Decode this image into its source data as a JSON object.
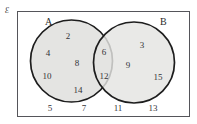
{
  "figure": {
    "type": "venn-diagram",
    "universe_label": "Ɛ",
    "set_a_label": "A",
    "set_b_label": "B",
    "colors": {
      "circle_fill": "#e4e4e2",
      "circle_stroke": "#1d1d1d",
      "rect_stroke": "#55555a",
      "background": "#ffffff",
      "text": "#333337"
    },
    "regions": {
      "a_only": {
        "name": "A only",
        "members": [
          {
            "value": "2",
            "x": 68,
            "y": 36
          },
          {
            "value": "4",
            "x": 48,
            "y": 53
          },
          {
            "value": "8",
            "x": 77,
            "y": 63
          },
          {
            "value": "10",
            "x": 47,
            "y": 76
          },
          {
            "value": "14",
            "x": 78,
            "y": 90
          }
        ]
      },
      "intersection": {
        "name": "A and B",
        "members": [
          {
            "value": "6",
            "x": 104,
            "y": 52
          },
          {
            "value": "12",
            "x": 104,
            "y": 76
          }
        ]
      },
      "b_only": {
        "name": "B only",
        "members": [
          {
            "value": "3",
            "x": 142,
            "y": 45
          },
          {
            "value": "9",
            "x": 128,
            "y": 65
          },
          {
            "value": "15",
            "x": 158,
            "y": 77
          }
        ]
      },
      "outside": {
        "name": "Outside A and B",
        "members": [
          {
            "value": "5",
            "x": 50,
            "y": 108
          },
          {
            "value": "7",
            "x": 84,
            "y": 108
          },
          {
            "value": "11",
            "x": 118,
            "y": 108
          },
          {
            "value": "13",
            "x": 153,
            "y": 108
          }
        ]
      }
    },
    "circle_a": {
      "cx": 71.5,
      "cy": 61,
      "r": 41
    },
    "circle_b": {
      "cx": 134,
      "cy": 62.5,
      "r": 40.5
    }
  }
}
